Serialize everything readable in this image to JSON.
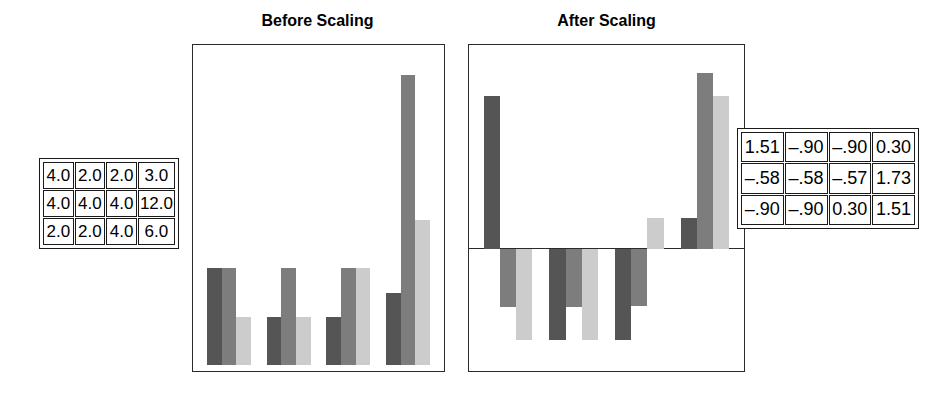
{
  "chart_data": [
    {
      "type": "bar",
      "id": "before-scaling",
      "title": "Before Scaling",
      "xlabel": "",
      "ylabel": "",
      "ylim": [
        0,
        13.0
      ],
      "baseline": 0,
      "grid": false,
      "legend": "none",
      "categories": [
        "1",
        "2",
        "3",
        "4"
      ],
      "series": [
        {
          "name": "series-1",
          "color": "#555555",
          "values": [
            4.0,
            2.0,
            2.0,
            3.0
          ]
        },
        {
          "name": "series-2",
          "color": "#7d7d7d",
          "values": [
            4.0,
            4.0,
            4.0,
            12.0
          ]
        },
        {
          "name": "series-3",
          "color": "#cccccc",
          "values": [
            2.0,
            2.0,
            4.0,
            6.0
          ]
        }
      ]
    },
    {
      "type": "bar",
      "id": "after-scaling",
      "title": "After Scaling",
      "xlabel": "",
      "ylabel": "",
      "ylim": [
        -1.15,
        1.95
      ],
      "baseline": 0,
      "grid": false,
      "legend": "none",
      "categories": [
        "1",
        "2",
        "3",
        "4"
      ],
      "series": [
        {
          "name": "series-1",
          "color": "#555555",
          "values": [
            1.51,
            -0.9,
            -0.9,
            0.3
          ]
        },
        {
          "name": "series-2",
          "color": "#7d7d7d",
          "values": [
            -0.58,
            -0.58,
            -0.57,
            1.73
          ]
        },
        {
          "name": "series-3",
          "color": "#cccccc",
          "values": [
            -0.9,
            -0.9,
            0.3,
            1.51
          ]
        }
      ]
    }
  ],
  "tables": {
    "before": {
      "name": "before-scaling-values",
      "rows": [
        [
          "4.0",
          "2.0",
          "2.0",
          "3.0"
        ],
        [
          "4.0",
          "4.0",
          "4.0",
          "12.0"
        ],
        [
          "2.0",
          "2.0",
          "4.0",
          "6.0"
        ]
      ]
    },
    "after": {
      "name": "after-scaling-values",
      "rows": [
        [
          "1.51",
          "–.90",
          "–.90",
          "0.30"
        ],
        [
          "–.58",
          "–.58",
          "–.57",
          "1.73"
        ],
        [
          "–.90",
          "–.90",
          "0.30",
          "1.51"
        ]
      ]
    }
  },
  "colors": {
    "series_1": "#555555",
    "series_2": "#7d7d7d",
    "series_3": "#cccccc",
    "frame": "#2b2b2b",
    "background": "#ffffff",
    "text": "#000000"
  }
}
